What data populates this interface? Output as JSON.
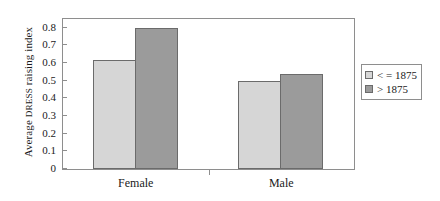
{
  "chart_data": {
    "type": "bar",
    "title": "",
    "xlabel": "",
    "ylabel": "Average DRESS raising index",
    "ylabel_prefix": "Average ",
    "ylabel_smallcaps": "DRESS",
    "ylabel_suffix": " raising index",
    "categories": [
      "Female",
      "Male"
    ],
    "series": [
      {
        "name": "< = 1875",
        "values": [
          0.62,
          0.5
        ],
        "color": "#d6d6d6"
      },
      {
        "name": "> 1875",
        "values": [
          0.8,
          0.54
        ],
        "color": "#9b9b9b"
      }
    ],
    "ylim": [
      0,
      0.85
    ],
    "yticks": [
      0,
      0.1,
      0.2,
      0.3,
      0.4,
      0.5,
      0.6,
      0.7,
      0.8
    ],
    "ytick_labels": [
      "0",
      "0.1",
      "0.2",
      "0.3",
      "0.4",
      "0.5",
      "0.6",
      "0.7",
      "0.8"
    ],
    "grid": false,
    "legend_position": "right"
  },
  "legend": {
    "entries": [
      {
        "label": "< = 1875",
        "color": "#d6d6d6"
      },
      {
        "label": "> 1875",
        "color": "#9b9b9b"
      }
    ]
  }
}
